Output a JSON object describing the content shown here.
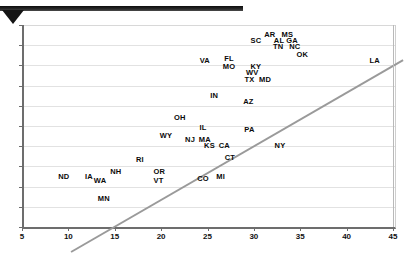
{
  "banner": {
    "label": "top-banner-bar",
    "marker": "down-triangle"
  },
  "chart_data": {
    "type": "scatter",
    "title": "",
    "subtitle": "",
    "xlabel": "",
    "ylabel": "",
    "xlim": [
      5,
      45
    ],
    "ylim": [
      0,
      10
    ],
    "xticks": [
      5,
      10,
      15,
      20,
      25,
      30,
      35,
      40,
      45
    ],
    "yticks": [
      0,
      1,
      2,
      3,
      4,
      5,
      6,
      7,
      8,
      9,
      10
    ],
    "grid": "horizontal",
    "legend": "none",
    "point_style": "text-label-only",
    "trendline": {
      "type": "line",
      "x": [
        7.7,
        43.5
      ],
      "y": [
        0.0,
        9.5
      ]
    },
    "points": [
      {
        "label": "ND",
        "x": 9.3,
        "y": 2.5
      },
      {
        "label": "IA",
        "x": 12.0,
        "y": 2.5
      },
      {
        "label": "WA",
        "x": 13.2,
        "y": 2.3
      },
      {
        "label": "MN",
        "x": 13.6,
        "y": 1.4
      },
      {
        "label": "NH",
        "x": 14.9,
        "y": 2.7
      },
      {
        "label": "RI",
        "x": 17.5,
        "y": 3.3
      },
      {
        "label": "OR",
        "x": 19.6,
        "y": 2.7
      },
      {
        "label": "VT",
        "x": 19.5,
        "y": 2.3
      },
      {
        "label": "WY",
        "x": 20.3,
        "y": 4.5
      },
      {
        "label": "OH",
        "x": 21.8,
        "y": 5.4
      },
      {
        "label": "IN",
        "x": 25.5,
        "y": 6.5
      },
      {
        "label": "NJ",
        "x": 22.9,
        "y": 4.3
      },
      {
        "label": "IL",
        "x": 24.3,
        "y": 4.9
      },
      {
        "label": "MA",
        "x": 24.5,
        "y": 4.3
      },
      {
        "label": "KS",
        "x": 25.0,
        "y": 4.0
      },
      {
        "label": "CA",
        "x": 26.6,
        "y": 4.0
      },
      {
        "label": "CT",
        "x": 27.2,
        "y": 3.4
      },
      {
        "label": "CO",
        "x": 24.3,
        "y": 2.4
      },
      {
        "label": "MI",
        "x": 26.2,
        "y": 2.5
      },
      {
        "label": "PA",
        "x": 29.3,
        "y": 4.8
      },
      {
        "label": "NY",
        "x": 32.6,
        "y": 4.0
      },
      {
        "label": "AZ",
        "x": 29.2,
        "y": 6.2
      },
      {
        "label": "VA",
        "x": 24.5,
        "y": 8.2
      },
      {
        "label": "FL",
        "x": 27.1,
        "y": 8.3
      },
      {
        "label": "MO",
        "x": 27.1,
        "y": 7.9
      },
      {
        "label": "KY",
        "x": 30.0,
        "y": 7.9
      },
      {
        "label": "WV",
        "x": 29.6,
        "y": 7.6
      },
      {
        "label": "TX",
        "x": 29.3,
        "y": 7.3
      },
      {
        "label": "MD",
        "x": 31.0,
        "y": 7.3
      },
      {
        "label": "SC",
        "x": 30.0,
        "y": 9.2
      },
      {
        "label": "AR",
        "x": 31.5,
        "y": 9.5
      },
      {
        "label": "MS",
        "x": 33.4,
        "y": 9.5
      },
      {
        "label": "AL",
        "x": 32.5,
        "y": 9.2
      },
      {
        "label": "GA",
        "x": 33.9,
        "y": 9.2
      },
      {
        "label": "TN",
        "x": 32.4,
        "y": 8.9
      },
      {
        "label": "NC",
        "x": 34.2,
        "y": 8.9
      },
      {
        "label": "OK",
        "x": 35.0,
        "y": 8.5
      },
      {
        "label": "LA",
        "x": 42.8,
        "y": 8.2
      }
    ]
  }
}
